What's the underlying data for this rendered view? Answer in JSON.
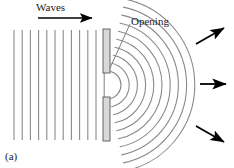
{
  "figure": {
    "panel_label": "(a)",
    "labels": {
      "waves": "Waves",
      "opening": "Opening"
    },
    "colors": {
      "wavefront": "#8a8a8a",
      "barrier_fill": "#d9d9d9",
      "barrier_stroke": "#555555",
      "arrow": "#000000",
      "leader": "#6e6e6e",
      "text": "#1a1a1a",
      "background": "#ffffff"
    },
    "plane_waves": {
      "count": 12,
      "x_start": 14,
      "spacing": 8.2,
      "y_top": 30,
      "y_bottom": 140,
      "direction": "left-to-right"
    },
    "direction_arrow": {
      "x1": 38,
      "y1": 18,
      "x2": 92,
      "y2": 18
    },
    "barrier": {
      "x": 103,
      "width": 7,
      "upper": {
        "y": 29,
        "height": 44
      },
      "lower": {
        "y": 97,
        "height": 44
      },
      "slit": {
        "y": 73,
        "height": 24
      }
    },
    "opening_leader": {
      "x1": 130,
      "y1": 24,
      "x2": 110,
      "y2": 68
    },
    "circular_wavefronts": {
      "count": 10,
      "center_x": 107,
      "center_y": 85,
      "first_radius": 14,
      "spacing": 8.2,
      "angle_start_deg": -78,
      "angle_end_deg": 78
    },
    "arrows": [
      {
        "name": "arrow-upper",
        "x1": 196,
        "y1": 44,
        "x2": 224,
        "y2": 28,
        "angle_deg": -30
      },
      {
        "name": "arrow-middle",
        "x1": 200,
        "y1": 84,
        "x2": 226,
        "y2": 84,
        "angle_deg": 0
      },
      {
        "name": "arrow-lower",
        "x1": 196,
        "y1": 126,
        "x2": 224,
        "y2": 142,
        "angle_deg": 30
      }
    ]
  }
}
